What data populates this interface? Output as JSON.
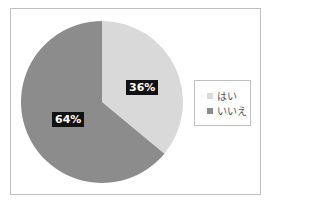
{
  "chart_data": {
    "type": "pie",
    "title": "",
    "categories": [
      "はい",
      "いいえ"
    ],
    "values": [
      36,
      64
    ],
    "labels": [
      "36%",
      "64%"
    ],
    "colors": [
      "#d9d9d9",
      "#8c8c8c"
    ],
    "legend_position": "right",
    "start_angle_deg": 0,
    "direction": "clockwise"
  },
  "legend": {
    "items": [
      {
        "label": "はい",
        "color": "#d9d9d9"
      },
      {
        "label": "いいえ",
        "color": "#8c8c8c"
      }
    ]
  }
}
